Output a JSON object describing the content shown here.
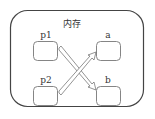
{
  "diagram": {
    "container": {
      "label": "内存"
    },
    "nodes": [
      {
        "id": "p1",
        "label": "p1"
      },
      {
        "id": "p2",
        "label": "p2"
      },
      {
        "id": "a",
        "label": "a"
      },
      {
        "id": "b",
        "label": "b"
      }
    ],
    "edges": [
      {
        "from": "p1",
        "to": "b"
      },
      {
        "from": "p2",
        "to": "a"
      }
    ],
    "colors": {
      "stroke": "#555555",
      "text": "#333333",
      "background": "#ffffff"
    }
  }
}
